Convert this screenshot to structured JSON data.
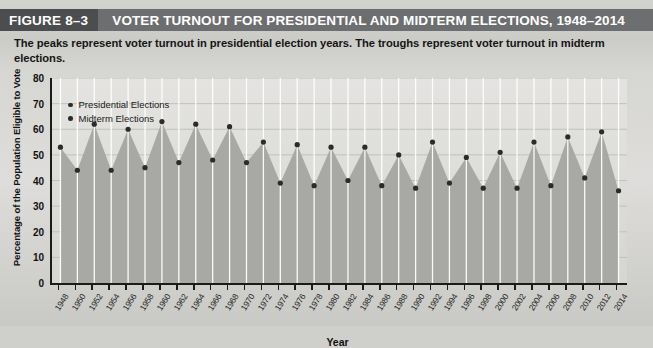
{
  "figure": {
    "number_label": "FIGURE 8–3",
    "title": "VOTER TURNOUT FOR PRESIDENTIAL AND MIDTERM ELECTIONS, 1948–2014",
    "caption": "The peaks represent voter turnout in presidential election years. The troughs represent voter turnout in midterm elections."
  },
  "colors": {
    "title_bar": "#6d6e70",
    "figure_number_block": "#4c4d4f",
    "title_text": "#ffffff",
    "area_fill": "#a8a8a4",
    "marker": "#2b2b2b",
    "axis": "#1b1b1b",
    "gridline": "#ffffff",
    "plot_background": "#dedddb"
  },
  "chart_data": {
    "type": "area",
    "title": "VOTER TURNOUT FOR PRESIDENTIAL AND MIDTERM ELECTIONS, 1948–2014",
    "xlabel": "Year",
    "ylabel": "Percentage of the Population Eligible to Vote",
    "ylim": [
      0,
      80
    ],
    "yticks": [
      0,
      10,
      20,
      30,
      40,
      50,
      60,
      70,
      80
    ],
    "grid": true,
    "legend_position": "top-left",
    "legend": [
      {
        "label": "Presidential Elections",
        "marker": "dot",
        "color": "#2b2b2b"
      },
      {
        "label": "Midterm Elections",
        "marker": "dot",
        "color": "#2b2b2b"
      }
    ],
    "categories": [
      "1948",
      "1950",
      "1952",
      "1954",
      "1956",
      "1958",
      "1960",
      "1962",
      "1964",
      "1966",
      "1968",
      "1970",
      "1972",
      "1974",
      "1976",
      "1978",
      "1980",
      "1982",
      "1984",
      "1986",
      "1988",
      "1990",
      "1992",
      "1994",
      "1996",
      "1998",
      "2000",
      "2002",
      "2004",
      "2006",
      "2008",
      "2010",
      "2012",
      "2014"
    ],
    "values": [
      53,
      44,
      62,
      44,
      60,
      45,
      63,
      47,
      62,
      48,
      61,
      47,
      55,
      39,
      54,
      38,
      53,
      40,
      53,
      38,
      50,
      37,
      55,
      39,
      49,
      37,
      51,
      37,
      55,
      38,
      57,
      41,
      59,
      36
    ],
    "series": [
      {
        "name": "Presidential Elections",
        "points": [
          {
            "x": "1948",
            "y": 53
          },
          {
            "x": "1952",
            "y": 62
          },
          {
            "x": "1956",
            "y": 60
          },
          {
            "x": "1960",
            "y": 63
          },
          {
            "x": "1964",
            "y": 62
          },
          {
            "x": "1968",
            "y": 61
          },
          {
            "x": "1972",
            "y": 55
          },
          {
            "x": "1976",
            "y": 54
          },
          {
            "x": "1980",
            "y": 53
          },
          {
            "x": "1984",
            "y": 53
          },
          {
            "x": "1988",
            "y": 50
          },
          {
            "x": "1992",
            "y": 55
          },
          {
            "x": "1996",
            "y": 49
          },
          {
            "x": "2000",
            "y": 51
          },
          {
            "x": "2004",
            "y": 55
          },
          {
            "x": "2008",
            "y": 57
          },
          {
            "x": "2012",
            "y": 59
          }
        ]
      },
      {
        "name": "Midterm Elections",
        "points": [
          {
            "x": "1950",
            "y": 44
          },
          {
            "x": "1954",
            "y": 44
          },
          {
            "x": "1958",
            "y": 45
          },
          {
            "x": "1962",
            "y": 47
          },
          {
            "x": "1966",
            "y": 48
          },
          {
            "x": "1970",
            "y": 47
          },
          {
            "x": "1974",
            "y": 39
          },
          {
            "x": "1978",
            "y": 38
          },
          {
            "x": "1982",
            "y": 40
          },
          {
            "x": "1986",
            "y": 38
          },
          {
            "x": "1990",
            "y": 37
          },
          {
            "x": "1994",
            "y": 39
          },
          {
            "x": "1998",
            "y": 37
          },
          {
            "x": "2002",
            "y": 37
          },
          {
            "x": "2006",
            "y": 38
          },
          {
            "x": "2010",
            "y": 41
          },
          {
            "x": "2014",
            "y": 36
          }
        ]
      }
    ]
  }
}
